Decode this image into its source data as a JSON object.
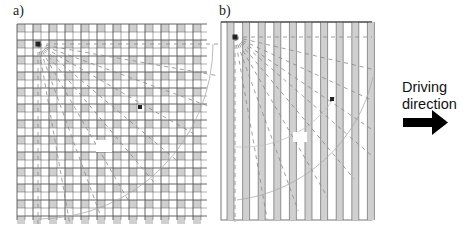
{
  "figure": {
    "panels": [
      {
        "id": "a",
        "label": "a)",
        "pattern": "square-grid",
        "x": 17,
        "y": 24,
        "width": 190,
        "height": 196
      },
      {
        "id": "b",
        "label": "b)",
        "pattern": "vertical-stripes",
        "x": 221,
        "y": 22,
        "width": 151,
        "height": 198
      }
    ],
    "annotation": {
      "text_line1": "Driving",
      "text_line2": "direction",
      "arrow": "right-arrow-icon"
    },
    "small_marker_label": "α",
    "colors": {
      "grid_line": "#555555",
      "grid_fill": "#d0d0d0",
      "dash": "#888888",
      "text": "#111111"
    }
  }
}
